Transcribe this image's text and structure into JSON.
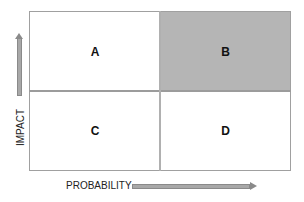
{
  "quadrants": {
    "top_left": {
      "label": "A",
      "fill": "#ffffff"
    },
    "top_right": {
      "label": "B",
      "fill": "#b5b5b5"
    },
    "bottom_left": {
      "label": "C",
      "fill": "#ffffff"
    },
    "bottom_right": {
      "label": "D",
      "fill": "#ffffff"
    }
  },
  "axes": {
    "y_label": "IMPACT",
    "x_label": "PROBABILITY",
    "y_arrow": "arrow-up-icon",
    "x_arrow": "arrow-right-icon"
  }
}
